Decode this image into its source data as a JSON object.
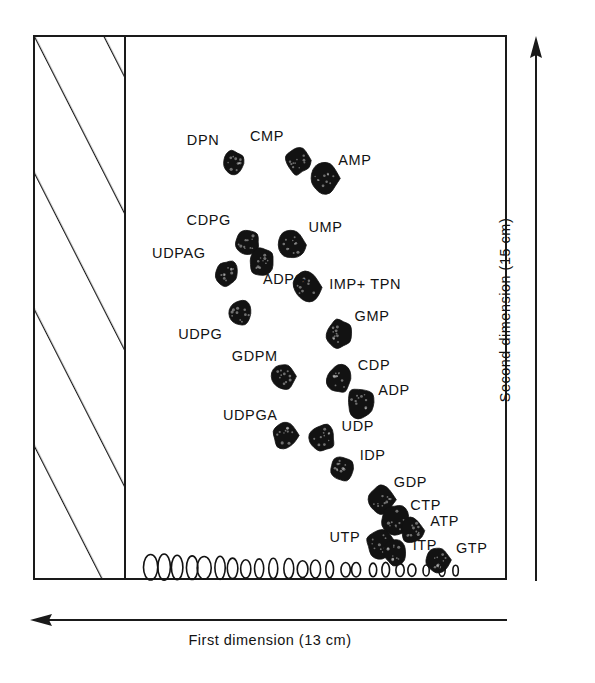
{
  "figure": {
    "type": "two-dimensional-chromatography-map",
    "axis_x_label": "First dimension (13 cm)",
    "axis_y_label": "Second dimension (15 cm)",
    "axis_x_direction": "left",
    "axis_y_direction": "up",
    "ink_color": "#121212",
    "background_color": "#ffffff"
  },
  "chart_data": {
    "type": "scatter",
    "title": "",
    "xlabel": "First dimension (13 cm)",
    "ylabel": "Second dimension (15 cm)",
    "xlim": [
      0,
      100
    ],
    "ylim": [
      0,
      100
    ],
    "grid": false,
    "legend": "none",
    "points": [
      {
        "label": "DPN",
        "x": 28.3,
        "y": 77.9,
        "label_dx": -14,
        "label_dy": -24
      },
      {
        "label": "CMP",
        "x": 45.4,
        "y": 78.5,
        "label_dx": -14,
        "label_dy": -24
      },
      {
        "label": "AMP",
        "x": 52.3,
        "y": 75.1,
        "label_dx": 14,
        "label_dy": -18
      },
      {
        "label": "CDPG",
        "x": 31.9,
        "y": 63.2,
        "label_dx": -16,
        "label_dy": -22
      },
      {
        "label": "UMP",
        "x": 43.9,
        "y": 62.6,
        "label_dx": 16,
        "label_dy": -18
      },
      {
        "label": "UDPAG",
        "x": 26.8,
        "y": 57.3,
        "label_dx": -22,
        "label_dy": -20
      },
      {
        "label": "ADPG",
        "x": 35.6,
        "y": 59.6,
        "label_dx": 2,
        "label_dy": 18
      },
      {
        "label": "IMP+ TPN",
        "x": 47.8,
        "y": 54.6,
        "label_dx": 22,
        "label_dy": -4
      },
      {
        "label": "UDPG",
        "x": 30.2,
        "y": 49.7,
        "label_dx": -18,
        "label_dy": 20
      },
      {
        "label": "GMP",
        "x": 56.1,
        "y": 45.9,
        "label_dx": 16,
        "label_dy": -18
      },
      {
        "label": "GDPM",
        "x": 41.6,
        "y": 37.9,
        "label_dx": -6,
        "label_dy": -20
      },
      {
        "label": "CDP",
        "x": 56.4,
        "y": 37.4,
        "label_dx": 18,
        "label_dy": -14
      },
      {
        "label": "ADP",
        "x": 61.8,
        "y": 33.0,
        "label_dx": 18,
        "label_dy": -12
      },
      {
        "label": "UDPGA",
        "x": 42.1,
        "y": 26.8,
        "label_dx": -8,
        "label_dy": -20
      },
      {
        "label": "UDP",
        "x": 51.6,
        "y": 26.3,
        "label_dx": 20,
        "label_dy": -12
      },
      {
        "label": "IDP",
        "x": 56.9,
        "y": 20.5,
        "label_dx": 18,
        "label_dy": -14
      },
      {
        "label": "GDP",
        "x": 67.5,
        "y": 14.7,
        "label_dx": 12,
        "label_dy": -18
      },
      {
        "label": "CTP",
        "x": 71.3,
        "y": 10.8,
        "label_dx": 14,
        "label_dy": -16
      },
      {
        "label": "ATP",
        "x": 75.5,
        "y": 8.9,
        "label_dx": 18,
        "label_dy": -10
      },
      {
        "label": "UTP",
        "x": 67.1,
        "y": 6.6,
        "label_dx": -20,
        "label_dy": -6
      },
      {
        "label": "ITP",
        "x": 70.9,
        "y": 4.7,
        "label_dx": 18,
        "label_dy": -8
      },
      {
        "label": "GTP",
        "x": 82.3,
        "y": 3.4,
        "label_dx": 18,
        "label_dy": -12
      }
    ],
    "baseline_open_spots_count": 23
  }
}
